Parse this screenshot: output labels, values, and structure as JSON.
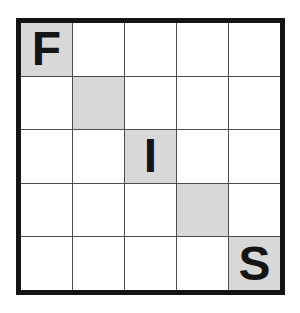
{
  "grid": {
    "rows": 5,
    "cols": 5,
    "colors": {
      "border": "#141414",
      "grid_line": "#4d4d4d",
      "cell": "#ffffff",
      "shaded_cell": "#d8d8d8",
      "letter": "#141414"
    },
    "cells": [
      [
        {
          "letter": "F",
          "shaded": true
        },
        {
          "letter": "",
          "shaded": false
        },
        {
          "letter": "",
          "shaded": false
        },
        {
          "letter": "",
          "shaded": false
        },
        {
          "letter": "",
          "shaded": false
        }
      ],
      [
        {
          "letter": "",
          "shaded": false
        },
        {
          "letter": "",
          "shaded": true
        },
        {
          "letter": "",
          "shaded": false
        },
        {
          "letter": "",
          "shaded": false
        },
        {
          "letter": "",
          "shaded": false
        }
      ],
      [
        {
          "letter": "",
          "shaded": false
        },
        {
          "letter": "",
          "shaded": false
        },
        {
          "letter": "I",
          "shaded": true
        },
        {
          "letter": "",
          "shaded": false
        },
        {
          "letter": "",
          "shaded": false
        }
      ],
      [
        {
          "letter": "",
          "shaded": false
        },
        {
          "letter": "",
          "shaded": false
        },
        {
          "letter": "",
          "shaded": false
        },
        {
          "letter": "",
          "shaded": true
        },
        {
          "letter": "",
          "shaded": false
        }
      ],
      [
        {
          "letter": "",
          "shaded": false
        },
        {
          "letter": "",
          "shaded": false
        },
        {
          "letter": "",
          "shaded": false
        },
        {
          "letter": "",
          "shaded": false
        },
        {
          "letter": "S",
          "shaded": true
        }
      ]
    ]
  }
}
